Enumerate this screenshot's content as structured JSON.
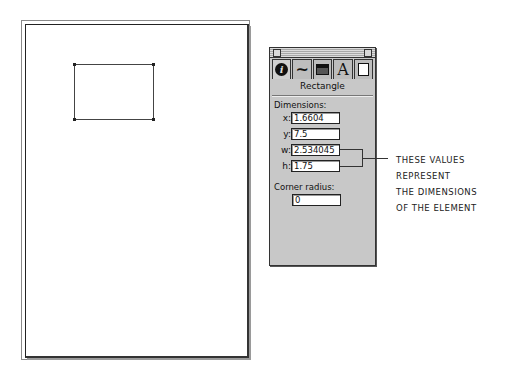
{
  "document": {
    "shape": "rectangle"
  },
  "palette": {
    "tabs": [
      {
        "icon": "info-icon",
        "glyph": "i"
      },
      {
        "icon": "stroke-icon",
        "glyph": "~"
      },
      {
        "icon": "fill-icon",
        "glyph": "▬"
      },
      {
        "icon": "text-icon",
        "glyph": "A"
      },
      {
        "icon": "page-icon",
        "glyph": "▯"
      }
    ],
    "title": "Rectangle",
    "dimensions_label": "Dimensions:",
    "fields": [
      {
        "label": "x:",
        "value": "1.6604"
      },
      {
        "label": "y:",
        "value": "7.5"
      },
      {
        "label": "w:",
        "value": "2.534045"
      },
      {
        "label": "h:",
        "value": "1.75"
      }
    ],
    "corner_radius_label": "Corner radius:",
    "corner_radius_value": "0"
  },
  "annotation": {
    "lines": [
      "THESE VALUES",
      "REPRESENT",
      "THE DIMENSIONS",
      "OF THE ELEMENT"
    ]
  }
}
